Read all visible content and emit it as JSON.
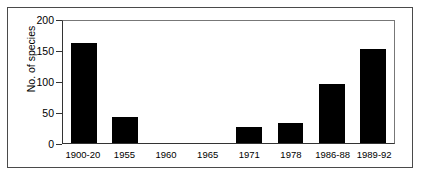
{
  "chart_data": {
    "type": "bar",
    "title": "",
    "xlabel": "",
    "ylabel": "No. of species",
    "categories": [
      "1900-20",
      "1955",
      "1960",
      "1965",
      "1971",
      "1978",
      "1986-88",
      "1989-92"
    ],
    "values": [
      164,
      42,
      0,
      0,
      27,
      33,
      96,
      154
    ],
    "ylim": [
      0,
      200
    ],
    "yticks": [
      0,
      50,
      100,
      150,
      200
    ],
    "ytick_labels": [
      "0",
      "50",
      "100",
      "150",
      "200"
    ],
    "grid": false,
    "legend": null,
    "bar_color": "#000000",
    "axis_color": "#333333",
    "frame_color": "#4a4a4a",
    "background": "#ffffff"
  }
}
